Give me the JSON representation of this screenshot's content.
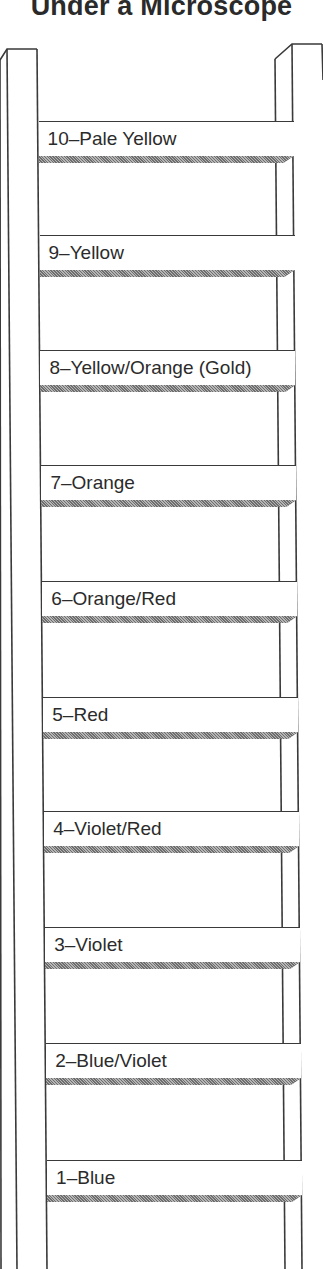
{
  "title": "Under a Microscope",
  "ladder": {
    "rungs": [
      {
        "level": 10,
        "label": "10–Pale Yellow",
        "top": 121
      },
      {
        "level": 9,
        "label": "9–Yellow",
        "top": 235
      },
      {
        "level": 8,
        "label": "8–Yellow/Orange (Gold)",
        "top": 350
      },
      {
        "level": 7,
        "label": "7–Orange",
        "top": 465
      },
      {
        "level": 6,
        "label": "6–Orange/Red",
        "top": 581
      },
      {
        "level": 5,
        "label": "5–Red",
        "top": 697
      },
      {
        "level": 4,
        "label": "4–Violet/Red",
        "top": 811
      },
      {
        "level": 3,
        "label": "3–Violet",
        "top": 927
      },
      {
        "level": 2,
        "label": "2–Blue/Violet",
        "top": 1043
      },
      {
        "level": 1,
        "label": "1–Blue",
        "top": 1160
      }
    ]
  },
  "colors": {
    "line": "#3a3a3a",
    "text": "#2b2b2b",
    "background": "#ffffff"
  }
}
